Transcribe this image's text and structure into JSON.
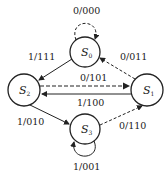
{
  "diagram": {
    "type": "state-transition",
    "states": [
      {
        "id": "S0",
        "base": "S",
        "sub": "0"
      },
      {
        "id": "S1",
        "base": "S",
        "sub": "1"
      },
      {
        "id": "S2",
        "base": "S",
        "sub": "2"
      },
      {
        "id": "S3",
        "base": "S",
        "sub": "3"
      }
    ],
    "transitions": [
      {
        "from": "S0",
        "to": "S0",
        "label": "0/000",
        "style": "dashed"
      },
      {
        "from": "S0",
        "to": "S2",
        "label": "1/111",
        "style": "solid"
      },
      {
        "from": "S1",
        "to": "S0",
        "label": "0/011",
        "style": "dashed"
      },
      {
        "from": "S2",
        "to": "S1",
        "label": "0/101",
        "style": "dashed"
      },
      {
        "from": "S1",
        "to": "S2",
        "label": "1/100",
        "style": "solid"
      },
      {
        "from": "S2",
        "to": "S3",
        "label": "1/010",
        "style": "solid"
      },
      {
        "from": "S3",
        "to": "S1",
        "label": "0/110",
        "style": "dashed"
      },
      {
        "from": "S3",
        "to": "S3",
        "label": "1/001",
        "style": "solid"
      }
    ]
  }
}
